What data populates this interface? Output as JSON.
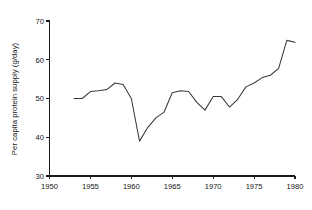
{
  "chart_data": {
    "type": "line",
    "title": "",
    "subtitle": "",
    "xlabel": "",
    "ylabel": "Per capita protein supply (g/day)",
    "xlim": [
      1950,
      1980
    ],
    "ylim": [
      30,
      70
    ],
    "xticks": [
      1950,
      1955,
      1960,
      1965,
      1970,
      1975,
      1980
    ],
    "yticks": [
      30,
      40,
      50,
      60,
      70
    ],
    "xtick_labels": [
      "1950",
      "1955",
      "1960",
      "1965",
      "1970",
      "1975",
      "1980"
    ],
    "ytick_labels": [
      "30",
      "40",
      "50",
      "60",
      "70"
    ],
    "grid": false,
    "legend": null,
    "legend_position": "none",
    "annotations": [],
    "series": [
      {
        "name": "Per capita protein supply",
        "color": "#3a3a3a",
        "x": [
          1953,
          1954,
          1955,
          1956,
          1957,
          1958,
          1959,
          1960,
          1961,
          1962,
          1963,
          1964,
          1965,
          1966,
          1967,
          1968,
          1969,
          1970,
          1971,
          1972,
          1973,
          1974,
          1975,
          1976,
          1977,
          1978,
          1979,
          1980
        ],
        "values": [
          50.0,
          50.0,
          51.8,
          52.0,
          52.3,
          54.0,
          53.6,
          50.0,
          39.0,
          42.5,
          45.0,
          46.5,
          51.5,
          52.0,
          51.8,
          49.0,
          47.0,
          50.5,
          50.5,
          47.8,
          49.8,
          53.0,
          54.0,
          55.4,
          56.0,
          57.8,
          65.0,
          64.5
        ]
      }
    ]
  },
  "axes": {
    "y_axis_title": "Per capita protein supply (g/day)"
  }
}
